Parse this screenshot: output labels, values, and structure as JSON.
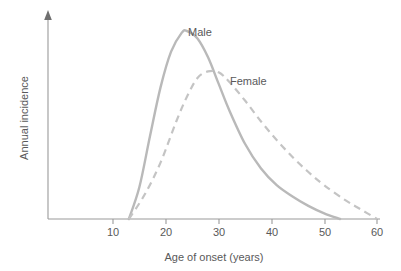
{
  "chart_data": {
    "type": "line",
    "title": "",
    "xlabel": "Age of onset (years)",
    "ylabel": "Annual incidence",
    "xlim": [
      5,
      62
    ],
    "ylim": [
      0,
      1.08
    ],
    "xticks": [
      10,
      20,
      30,
      40,
      50,
      60
    ],
    "xtick_labels": [
      "10",
      "20",
      "30",
      "40",
      "50",
      "60"
    ],
    "yticks": [],
    "ytick_labels": [],
    "grid": false,
    "legend_position": "inline-annotations",
    "annotations": [
      {
        "text": "Male",
        "x": 26.5,
        "y": 1.0
      },
      {
        "text": "Female",
        "x": 35.5,
        "y": 0.74
      }
    ],
    "series": [
      {
        "name": "Male",
        "style": "solid",
        "color": "#b9b9b9",
        "peak_x": 24,
        "peak_y": 1.0,
        "onset_x": 13,
        "end_x": 53,
        "x": [
          13,
          15,
          17,
          19,
          21,
          23,
          24,
          26,
          28,
          30,
          32,
          35,
          38,
          41,
          44,
          47,
          50,
          53
        ],
        "y": [
          0.0,
          0.17,
          0.44,
          0.7,
          0.89,
          0.99,
          1.0,
          0.96,
          0.86,
          0.72,
          0.58,
          0.4,
          0.27,
          0.18,
          0.12,
          0.07,
          0.03,
          0.0
        ]
      },
      {
        "name": "Female",
        "style": "dashed",
        "color": "#c4c4c4",
        "peak_x": 28,
        "peak_y": 0.785,
        "onset_x": 13,
        "end_x": 60,
        "x": [
          13,
          16,
          19,
          22,
          24,
          26,
          28,
          30,
          32,
          35,
          38,
          41,
          44,
          47,
          50,
          54,
          57,
          60
        ],
        "y": [
          0.0,
          0.13,
          0.3,
          0.52,
          0.65,
          0.75,
          0.785,
          0.78,
          0.73,
          0.63,
          0.52,
          0.42,
          0.33,
          0.25,
          0.18,
          0.1,
          0.05,
          0.0
        ]
      }
    ]
  },
  "axis": {
    "x_title": "Age of onset (years)",
    "y_title": "Annual incidence",
    "x_tick_labels": [
      "10",
      "20",
      "30",
      "40",
      "50",
      "60"
    ]
  },
  "labels": {
    "male": "Male",
    "female": "Female"
  },
  "colors": {
    "male_curve": "#b9b9b9",
    "female_curve": "#c4c4c4",
    "axis": "#9a9a9a",
    "text": "#59595a",
    "background": "#ffffff"
  }
}
